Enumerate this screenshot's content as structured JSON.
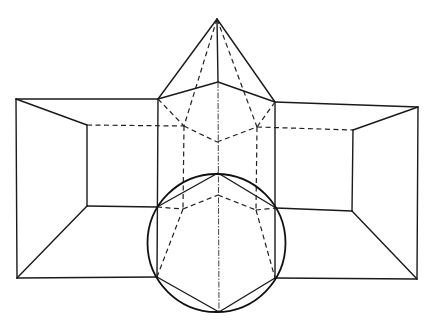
{
  "figure": {
    "colors": {
      "ink": "#1a1a1a",
      "background": "#ffffff"
    },
    "points": {
      "apex": [
        217,
        19
      ],
      "pyr_front": [
        218,
        82
      ],
      "pyr_left": [
        158,
        99
      ],
      "pyr_right": [
        275,
        102
      ],
      "pyr_back_left": [
        184,
        126
      ],
      "pyr_back_right": [
        257,
        127
      ],
      "pyr_back_center": [
        217,
        142
      ],
      "outer_tl": [
        16,
        99
      ],
      "outer_tr": [
        418,
        107
      ],
      "outer_bl": [
        17,
        278
      ],
      "outer_br": [
        417,
        279
      ],
      "inner_tl": [
        87,
        125
      ],
      "inner_tr": [
        353,
        130
      ],
      "inner_bl": [
        87,
        206
      ],
      "inner_br": [
        352,
        211
      ],
      "hex_top": [
        218,
        173
      ],
      "hex_ul": [
        157,
        207
      ],
      "hex_ur": [
        276,
        208
      ],
      "hex_ll": [
        157,
        277
      ],
      "hex_lr": [
        275,
        278
      ],
      "hex_bottom": [
        219,
        312
      ],
      "hex_back_top": [
        218,
        195
      ],
      "hex_back_left": [
        183,
        209
      ],
      "hex_back_right": [
        256,
        210
      ]
    },
    "circle": {
      "cx": 216.5,
      "cy": 243,
      "r": 69
    },
    "solid_lines": [
      [
        "apex",
        "pyr_left"
      ],
      [
        "apex",
        "pyr_right"
      ],
      [
        "apex",
        "pyr_front"
      ],
      [
        "pyr_left",
        "pyr_front"
      ],
      [
        "pyr_front",
        "pyr_right"
      ],
      [
        "outer_tl",
        "pyr_left"
      ],
      [
        "pyr_right",
        "outer_tr"
      ],
      [
        "outer_tl",
        "inner_tl"
      ],
      [
        "outer_tr",
        "inner_tr"
      ],
      [
        "outer_tl",
        "outer_bl"
      ],
      [
        "outer_tr",
        "outer_br"
      ],
      [
        "inner_tl",
        "inner_bl"
      ],
      [
        "inner_tr",
        "inner_br"
      ],
      [
        "outer_bl",
        "inner_bl"
      ],
      [
        "outer_br",
        "inner_br"
      ],
      [
        "inner_bl",
        "hex_ul"
      ],
      [
        "hex_ur",
        "inner_br"
      ],
      [
        "outer_bl",
        "hex_ll"
      ],
      [
        "hex_lr",
        "outer_br"
      ],
      [
        "pyr_left",
        "hex_ll"
      ],
      [
        "pyr_right",
        "hex_lr"
      ],
      [
        "hex_top",
        "hex_ul"
      ],
      [
        "hex_top",
        "hex_ur"
      ],
      [
        "hex_ll",
        "hex_bottom"
      ],
      [
        "hex_bottom",
        "hex_lr"
      ]
    ],
    "dashed_lines": [
      [
        "apex",
        "pyr_back_left"
      ],
      [
        "apex",
        "pyr_back_right"
      ],
      [
        "pyr_left",
        "pyr_back_left"
      ],
      [
        "pyr_right",
        "pyr_back_right"
      ],
      [
        "pyr_back_left",
        "pyr_back_center"
      ],
      [
        "pyr_back_center",
        "pyr_back_right"
      ],
      [
        "inner_tl",
        "pyr_back_left"
      ],
      [
        "pyr_back_right",
        "inner_tr"
      ],
      [
        "pyr_back_left",
        "hex_back_left"
      ],
      [
        "pyr_back_right",
        "hex_back_right"
      ],
      [
        "hex_ul",
        "hex_back_left"
      ],
      [
        "hex_back_left",
        "hex_back_top"
      ],
      [
        "hex_back_top",
        "hex_back_right"
      ],
      [
        "hex_back_right",
        "hex_ur"
      ],
      [
        "hex_back_left",
        "hex_ll"
      ],
      [
        "hex_back_right",
        "hex_lr"
      ]
    ],
    "axis_lines": [
      [
        "pyr_front",
        "hex_bottom"
      ]
    ]
  }
}
